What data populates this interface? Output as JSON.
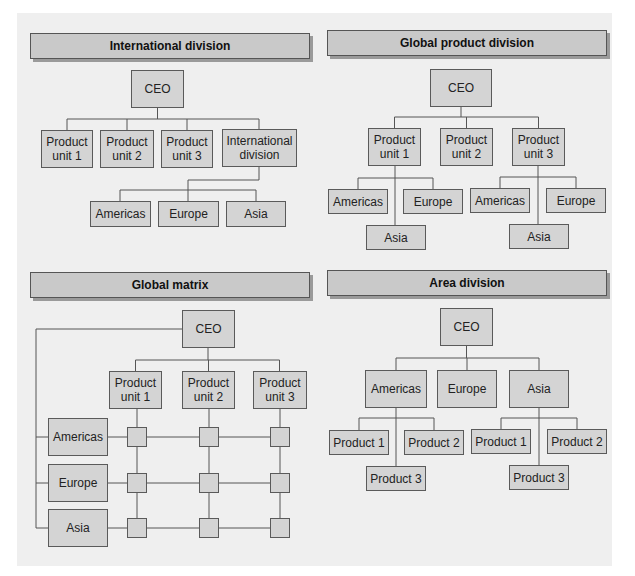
{
  "colors": {
    "page_background": "#ffffff",
    "panel_background": "#efefef",
    "title_bar_fill": "#c9c9c9",
    "node_fill": "#d4d4d4",
    "border": "#555555"
  },
  "diagrams": {
    "international_division": {
      "title": "International division",
      "ceo": "CEO",
      "level1": [
        "Product\nunit 1",
        "Product\nunit 2",
        "Product\nunit 3",
        "International\ndivision"
      ],
      "international_children": [
        "Americas",
        "Europe",
        "Asia"
      ]
    },
    "global_product_division": {
      "title": "Global product division",
      "ceo": "CEO",
      "level1": [
        "Product\nunit 1",
        "Product\nunit 2",
        "Product\nunit 3"
      ],
      "unit1_children": [
        "Americas",
        "Europe",
        "Asia"
      ],
      "unit3_children": [
        "Americas",
        "Europe",
        "Asia"
      ]
    },
    "global_matrix": {
      "title": "Global matrix",
      "ceo": "CEO",
      "columns": [
        "Product\nunit 1",
        "Product\nunit 2",
        "Product\nunit 3"
      ],
      "rows": [
        "Americas",
        "Europe",
        "Asia"
      ]
    },
    "area_division": {
      "title": "Area division",
      "ceo": "CEO",
      "level1": [
        "Americas",
        "Europe",
        "Asia"
      ],
      "americas_children": [
        "Product 1",
        "Product 2",
        "Product 3"
      ],
      "asia_children": [
        "Product 1",
        "Product 2",
        "Product 3"
      ]
    }
  }
}
